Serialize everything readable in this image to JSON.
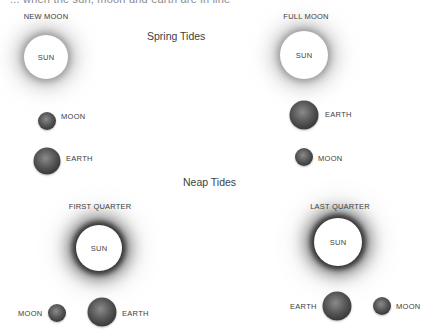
{
  "header": {
    "clipped_text": "... when the sun, moon and earth are in line"
  },
  "sections": {
    "spring_title": "Spring Tides",
    "neap_title": "Neap Tides"
  },
  "panels": [
    {
      "phase": "NEW MOON",
      "sun_label": "SUN",
      "bodies": [
        {
          "label": "MOON"
        },
        {
          "label": "EARTH"
        }
      ]
    },
    {
      "phase": "FULL MOON",
      "sun_label": "SUN",
      "bodies": [
        {
          "label": "EARTH"
        },
        {
          "label": "MOON"
        }
      ]
    },
    {
      "phase": "FIRST QUARTER",
      "sun_label": "SUN",
      "bodies": [
        {
          "label": "MOON"
        },
        {
          "label": "EARTH"
        }
      ]
    },
    {
      "phase": "LAST QUARTER",
      "sun_label": "SUN",
      "bodies": [
        {
          "label": "EARTH"
        },
        {
          "label": "MOON"
        }
      ]
    }
  ],
  "colors": {
    "background": "#ffffff",
    "text": "#3c3c3c",
    "sun": "#ffffff",
    "sphere_dark": "#1e1e1e",
    "sphere_light": "#8a8a8a"
  }
}
